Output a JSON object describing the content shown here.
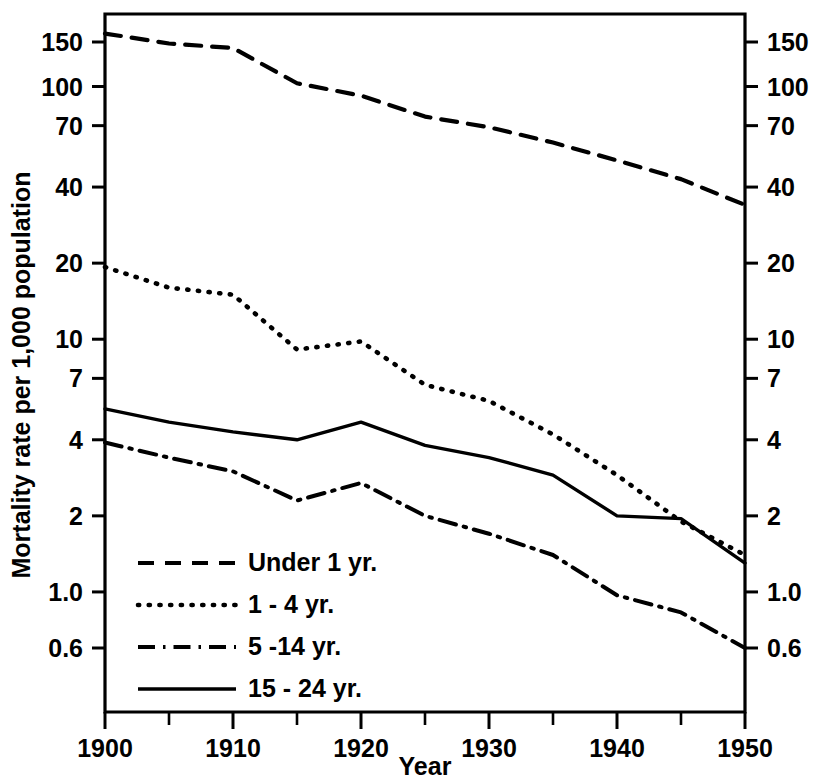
{
  "chart_data": {
    "type": "line",
    "title": "",
    "xlabel": "Year",
    "ylabel": "Mortality rate per 1,000 population",
    "yscale": "log",
    "ylim": [
      0.55,
      185
    ],
    "xlim": [
      1900,
      1950
    ],
    "grid": false,
    "legend_position": "lower-left-inside",
    "x_ticks": [
      1900,
      1910,
      1920,
      1930,
      1940,
      1950
    ],
    "x_tick_labels": [
      "1900",
      "1910",
      "1920",
      "1930",
      "1940",
      "1950"
    ],
    "x_minor_ticks": [
      1905,
      1915,
      1925,
      1935,
      1945
    ],
    "y_ticks": [
      150,
      100,
      70,
      40,
      20,
      10,
      7,
      4,
      2,
      1.0,
      0.6
    ],
    "y_tick_labels": [
      "150",
      "100",
      "70",
      "40",
      "20",
      "10",
      "7",
      "4",
      "2",
      "1.0",
      "0.6"
    ],
    "x": [
      1900,
      1905,
      1910,
      1915,
      1920,
      1925,
      1930,
      1935,
      1940,
      1945,
      1950
    ],
    "series": [
      {
        "name": "Under 1 yr.",
        "style": "dashed",
        "values": [
          162,
          148,
          142,
          103,
          92,
          76,
          69,
          60,
          51,
          43,
          34
        ]
      },
      {
        "name": "1 - 4 yr.",
        "style": "dotted",
        "values": [
          19.3,
          16.0,
          15.0,
          9.1,
          9.8,
          6.6,
          5.7,
          4.2,
          2.9,
          1.9,
          1.4
        ]
      },
      {
        "name": "5 -14 yr.",
        "style": "dashdot",
        "values": [
          3.9,
          3.4,
          3.0,
          2.3,
          2.7,
          2.0,
          1.7,
          1.4,
          0.97,
          0.83,
          0.6
        ]
      },
      {
        "name": "15 - 24 yr.",
        "style": "solid",
        "values": [
          5.3,
          4.7,
          4.3,
          4.0,
          4.7,
          3.8,
          3.4,
          2.9,
          2.0,
          1.95,
          1.3
        ]
      }
    ]
  },
  "legend": {
    "items": [
      {
        "label": "Under 1 yr.",
        "style": "dashed"
      },
      {
        "label": "1 - 4 yr.",
        "style": "dotted"
      },
      {
        "label": "5 -14 yr.",
        "style": "dashdot"
      },
      {
        "label": "15 - 24 yr.",
        "style": "solid"
      }
    ]
  },
  "colors": {
    "ink": "#000000",
    "background": "#ffffff"
  }
}
